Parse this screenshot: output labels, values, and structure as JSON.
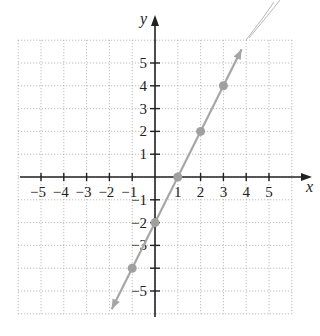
{
  "chart_data": {
    "type": "line",
    "title": "",
    "xlabel": "x",
    "ylabel": "y",
    "xlim": [
      -6,
      6
    ],
    "ylim": [
      -6,
      6
    ],
    "grid": true,
    "x_ticks": [
      -5,
      -4,
      -3,
      -2,
      -1,
      1,
      2,
      3,
      4,
      5
    ],
    "y_ticks": [
      -5,
      -4,
      -3,
      -2,
      -1,
      1,
      2,
      3,
      4,
      5
    ],
    "x_tick_labels": [
      "−5",
      "−4",
      "−3",
      "−2",
      "−1",
      "1",
      "2",
      "3",
      "4",
      "5"
    ],
    "y_tick_labels": [
      "−5",
      "",
      "−3",
      "−2",
      "−1",
      "1",
      "2",
      "3",
      "4",
      "5"
    ],
    "series": [
      {
        "name": "y = 2x - 2",
        "equation": "y = 2x - 2",
        "x": [
          -1.9,
          3.8
        ],
        "y": [
          -5.8,
          5.6
        ],
        "arrows": "both"
      }
    ],
    "points": [
      {
        "x": -1,
        "y": -4
      },
      {
        "x": 0,
        "y": -2
      },
      {
        "x": 1,
        "y": 0
      },
      {
        "x": 2,
        "y": 2
      },
      {
        "x": 3,
        "y": 4
      }
    ],
    "colors": {
      "line": "#a6a6a6",
      "points": "#a0a0a0",
      "axes": "#222222",
      "grid": "#9a9a9a"
    }
  }
}
